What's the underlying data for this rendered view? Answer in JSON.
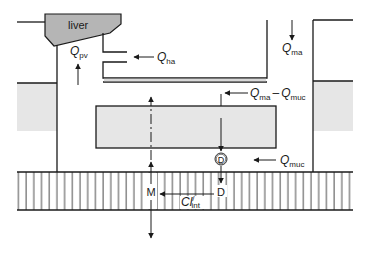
{
  "diagram": {
    "type": "compartment-flow-model",
    "labels": {
      "liver": "liver",
      "q_pv": {
        "main": "Q",
        "sub": "pv"
      },
      "q_ha": {
        "main": "Q",
        "sub": "ha"
      },
      "q_ma": {
        "main": "Q",
        "sub": "ma"
      },
      "q_ma_minus_q_muc": {
        "main1": "Q",
        "sub1": "ma",
        "op": "–",
        "main2": "Q",
        "sub2": "muc"
      },
      "q_muc": {
        "main": "Q",
        "sub": "muc"
      },
      "d_circled": "D",
      "d": "D",
      "m": "M",
      "cl_int": {
        "main": "Cl",
        "sup": "/",
        "sub": "int"
      }
    },
    "colors": {
      "line": "#1a1a1a",
      "tissue_fill": "#e6e6e6",
      "liver_fill": "#b5b5b5",
      "background": "#ffffff"
    }
  }
}
